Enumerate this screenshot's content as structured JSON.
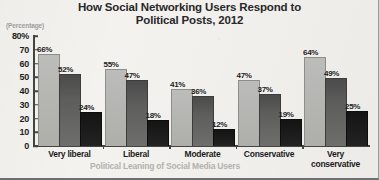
{
  "chart_data": {
    "type": "bar",
    "title": "How Social Networking Users Respond to Political Posts, 2012",
    "title_lines": [
      "How Social Networking Users Respond to",
      "Political Posts, 2012"
    ],
    "unit_caption": "(Percentage)",
    "xlabel": "Political Leaning of Social Media Users",
    "ylabel": "",
    "ylim": [
      0,
      80
    ],
    "grid": false,
    "legend": "none",
    "y_ticks": [
      {
        "value": 80,
        "label": "80%"
      },
      {
        "value": 70,
        "label": "70"
      },
      {
        "value": 60,
        "label": "60"
      },
      {
        "value": 50,
        "label": "50"
      },
      {
        "value": 40,
        "label": "40"
      },
      {
        "value": 30,
        "label": "30"
      },
      {
        "value": 20,
        "label": "20"
      },
      {
        "value": 10,
        "label": "10"
      },
      {
        "value": 0,
        "label": "0"
      }
    ],
    "categories": [
      "Very liberal",
      "Liberal",
      "Moderate",
      "Conservative",
      "Very conservative"
    ],
    "category_lines": [
      [
        "Very liberal"
      ],
      [
        "Liberal"
      ],
      [
        "Moderate"
      ],
      [
        "Conservative"
      ],
      [
        "Very",
        "conservative"
      ]
    ],
    "series": [
      {
        "name": "series-1",
        "color": "#b4b4b1",
        "values": [
          66,
          55,
          41,
          47,
          64
        ],
        "labels": [
          "66%",
          "55%",
          "41%",
          "47%",
          "64%"
        ]
      },
      {
        "name": "series-2",
        "color": "#5d5d5c",
        "values": [
          52,
          47,
          36,
          37,
          49
        ],
        "labels": [
          "52%",
          "47%",
          "36%",
          "37%",
          "49%"
        ]
      },
      {
        "name": "series-3",
        "color": "#1d1d1d",
        "values": [
          24,
          18,
          12,
          19,
          25
        ],
        "labels": [
          "24%",
          "18%",
          "12%",
          "19%",
          "25%"
        ]
      }
    ]
  }
}
